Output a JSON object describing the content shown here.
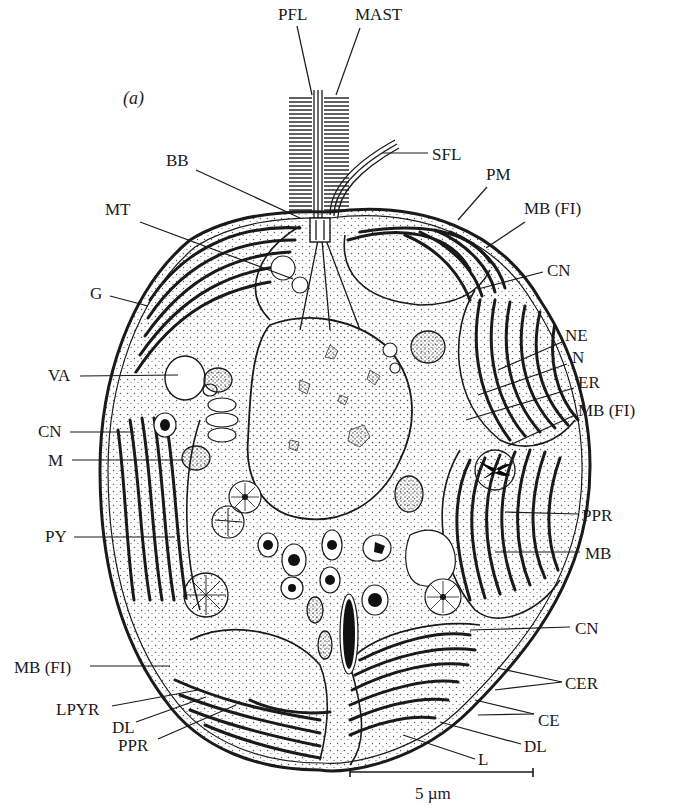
{
  "figure": {
    "panel_label": "(a)",
    "scale_bar": {
      "label": "5 µm",
      "x1": 350,
      "x2": 533,
      "y": 772
    },
    "colors": {
      "ink": "#1a1a1a",
      "background": "#ffffff",
      "stipple": "#555555"
    }
  },
  "labels": [
    {
      "id": "PFL",
      "text": "PFL",
      "x": 278,
      "y": 20,
      "tx": 312,
      "ty": 95,
      "lx": 297,
      "ly": 26
    },
    {
      "id": "MAST",
      "text": "MAST",
      "x": 355,
      "y": 20,
      "tx": 336,
      "ty": 95,
      "lx": 360,
      "ly": 28
    },
    {
      "id": "SFL",
      "text": "SFL",
      "x": 432,
      "y": 160,
      "tx": 382,
      "ty": 153,
      "lx": 428,
      "ly": 153
    },
    {
      "id": "BB",
      "text": "BB",
      "x": 166,
      "y": 166,
      "tx": 300,
      "ty": 218,
      "lx": 196,
      "ly": 170
    },
    {
      "id": "PM",
      "text": "PM",
      "x": 486,
      "y": 180,
      "tx": 458,
      "ty": 220,
      "lx": 487,
      "ly": 187
    },
    {
      "id": "MB_FI_1",
      "text": "MB (FI)",
      "x": 524,
      "y": 214,
      "tx": 486,
      "ty": 248,
      "lx": 525,
      "ly": 222
    },
    {
      "id": "MT",
      "text": "MT",
      "x": 105,
      "y": 215,
      "tx": 293,
      "ty": 279,
      "lx": 140,
      "ly": 222
    },
    {
      "id": "CN_1",
      "text": "CN",
      "x": 547,
      "y": 276,
      "tx": 478,
      "ty": 289,
      "lx": 543,
      "ly": 272
    },
    {
      "id": "G",
      "text": "G",
      "x": 90,
      "y": 299,
      "tx": 148,
      "ty": 306,
      "lx": 110,
      "ly": 296
    },
    {
      "id": "NE",
      "text": "NE",
      "x": 565,
      "y": 341,
      "tx": 498,
      "ty": 370,
      "lx": 562,
      "ly": 342
    },
    {
      "id": "N",
      "text": "N",
      "x": 572,
      "y": 363,
      "tx": 478,
      "ty": 395,
      "lx": 567,
      "ly": 364
    },
    {
      "id": "VA",
      "text": "VA",
      "x": 48,
      "y": 381,
      "tx": 178,
      "ty": 375,
      "lx": 80,
      "ly": 376
    },
    {
      "id": "ER",
      "text": "ER",
      "x": 578,
      "y": 388,
      "tx": 466,
      "ty": 420,
      "lx": 574,
      "ly": 388
    },
    {
      "id": "MB_FI_2",
      "text": "MB (FI)",
      "x": 578,
      "y": 416,
      "tx": 508,
      "ty": 446,
      "lx": 575,
      "ly": 415
    },
    {
      "id": "CN_2",
      "text": "CN",
      "x": 38,
      "y": 437,
      "tx": 135,
      "ty": 432,
      "lx": 70,
      "ly": 432
    },
    {
      "id": "M",
      "text": "M",
      "x": 48,
      "y": 466,
      "tx": 184,
      "ty": 460,
      "lx": 72,
      "ly": 460
    },
    {
      "id": "PY",
      "text": "PY",
      "x": 45,
      "y": 542,
      "tx": 175,
      "ty": 537,
      "lx": 74,
      "ly": 537
    },
    {
      "id": "PPR_1",
      "text": "PPR",
      "x": 582,
      "y": 521,
      "tx": 505,
      "ty": 512,
      "lx": 578,
      "ly": 514
    },
    {
      "id": "MB",
      "text": "MB",
      "x": 585,
      "y": 559,
      "tx": 495,
      "ty": 552,
      "lx": 580,
      "ly": 552
    },
    {
      "id": "CN_3",
      "text": "CN",
      "x": 575,
      "y": 634,
      "tx": 470,
      "ty": 630,
      "lx": 570,
      "ly": 627
    },
    {
      "id": "MB_FI_3",
      "text": "MB (FI)",
      "x": 14,
      "y": 673,
      "tx": 170,
      "ty": 666,
      "lx": 90,
      "ly": 666
    },
    {
      "id": "CER",
      "text": "CER",
      "x": 565,
      "y": 689,
      "tx": 497,
      "ty": 668,
      "lx": 562,
      "ly": 682,
      "tx2": 495,
      "ty2": 690
    },
    {
      "id": "LPYR",
      "text": "LPYR",
      "x": 56,
      "y": 715,
      "tx": 198,
      "ty": 690,
      "lx": 112,
      "ly": 706
    },
    {
      "id": "CE",
      "text": "CE",
      "x": 538,
      "y": 726,
      "tx": 475,
      "ty": 700,
      "lx": 534,
      "ly": 714,
      "tx2": 478,
      "ty2": 715
    },
    {
      "id": "DL_1",
      "text": "DL",
      "x": 112,
      "y": 733,
      "tx": 206,
      "ty": 697,
      "lx": 136,
      "ly": 722
    },
    {
      "id": "PPR_2",
      "text": "PPR",
      "x": 118,
      "y": 751,
      "tx": 236,
      "ty": 705,
      "lx": 158,
      "ly": 739
    },
    {
      "id": "DL_2",
      "text": "DL",
      "x": 524,
      "y": 752,
      "tx": 440,
      "ty": 722,
      "lx": 521,
      "ly": 744
    },
    {
      "id": "L",
      "text": "L",
      "x": 478,
      "y": 765,
      "tx": 403,
      "ty": 735,
      "lx": 475,
      "ly": 759
    }
  ]
}
